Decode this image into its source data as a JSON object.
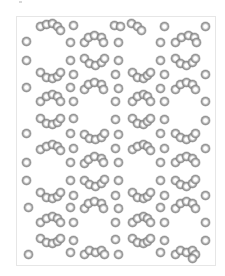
{
  "figure": {
    "sphere_color": "#7a7a7a",
    "highlight_color": "#ffffff",
    "frame_border_color": "#e6e6e6",
    "background_color": "#ffffff"
  },
  "spheres": [
    [
      40,
      26
    ],
    [
      46,
      24
    ],
    [
      52,
      23
    ],
    [
      57,
      26
    ],
    [
      60,
      30
    ],
    [
      73,
      25
    ],
    [
      114,
      25
    ],
    [
      120,
      26
    ],
    [
      131,
      23
    ],
    [
      137,
      26
    ],
    [
      141,
      30
    ],
    [
      164,
      26
    ],
    [
      205,
      26
    ],
    [
      26,
      41
    ],
    [
      70,
      42
    ],
    [
      84,
      42
    ],
    [
      88,
      37
    ],
    [
      94,
      35
    ],
    [
      101,
      37
    ],
    [
      103,
      42
    ],
    [
      118,
      42
    ],
    [
      160,
      42
    ],
    [
      175,
      42
    ],
    [
      181,
      37
    ],
    [
      188,
      35
    ],
    [
      194,
      37
    ],
    [
      196,
      42
    ],
    [
      26,
      60
    ],
    [
      70,
      60
    ],
    [
      84,
      58
    ],
    [
      89,
      63
    ],
    [
      95,
      65
    ],
    [
      101,
      62
    ],
    [
      104,
      58
    ],
    [
      118,
      60
    ],
    [
      160,
      60
    ],
    [
      175,
      58
    ],
    [
      180,
      63
    ],
    [
      186,
      65
    ],
    [
      192,
      62
    ],
    [
      195,
      58
    ],
    [
      40,
      72
    ],
    [
      46,
      77
    ],
    [
      52,
      78
    ],
    [
      57,
      76
    ],
    [
      60,
      72
    ],
    [
      73,
      74
    ],
    [
      115,
      74
    ],
    [
      132,
      72
    ],
    [
      137,
      77
    ],
    [
      143,
      78
    ],
    [
      147,
      75
    ],
    [
      150,
      72
    ],
    [
      164,
      74
    ],
    [
      205,
      74
    ],
    [
      26,
      87
    ],
    [
      70,
      87
    ],
    [
      84,
      89
    ],
    [
      88,
      84
    ],
    [
      94,
      82
    ],
    [
      101,
      84
    ],
    [
      103,
      89
    ],
    [
      118,
      88
    ],
    [
      160,
      88
    ],
    [
      175,
      89
    ],
    [
      180,
      84
    ],
    [
      186,
      82
    ],
    [
      192,
      84
    ],
    [
      195,
      89
    ],
    [
      40,
      101
    ],
    [
      46,
      96
    ],
    [
      52,
      94
    ],
    [
      57,
      96
    ],
    [
      60,
      101
    ],
    [
      73,
      101
    ],
    [
      115,
      101
    ],
    [
      132,
      101
    ],
    [
      137,
      96
    ],
    [
      143,
      94
    ],
    [
      147,
      96
    ],
    [
      150,
      101
    ],
    [
      164,
      101
    ],
    [
      205,
      101
    ],
    [
      40,
      118
    ],
    [
      46,
      123
    ],
    [
      52,
      124
    ],
    [
      57,
      122
    ],
    [
      60,
      118
    ],
    [
      73,
      118
    ],
    [
      115,
      119
    ],
    [
      132,
      118
    ],
    [
      137,
      123
    ],
    [
      143,
      124
    ],
    [
      147,
      121
    ],
    [
      150,
      118
    ],
    [
      164,
      119
    ],
    [
      205,
      120
    ],
    [
      26,
      133
    ],
    [
      70,
      133
    ],
    [
      84,
      134
    ],
    [
      89,
      138
    ],
    [
      95,
      139
    ],
    [
      101,
      137
    ],
    [
      104,
      133
    ],
    [
      118,
      134
    ],
    [
      160,
      133
    ],
    [
      175,
      133
    ],
    [
      180,
      137
    ],
    [
      186,
      139
    ],
    [
      192,
      137
    ],
    [
      195,
      133
    ],
    [
      40,
      149
    ],
    [
      46,
      146
    ],
    [
      52,
      144
    ],
    [
      57,
      146
    ],
    [
      60,
      150
    ],
    [
      73,
      148
    ],
    [
      115,
      148
    ],
    [
      132,
      149
    ],
    [
      137,
      146
    ],
    [
      143,
      144
    ],
    [
      147,
      146
    ],
    [
      150,
      150
    ],
    [
      164,
      148
    ],
    [
      205,
      148
    ],
    [
      26,
      162
    ],
    [
      70,
      162
    ],
    [
      84,
      163
    ],
    [
      88,
      159
    ],
    [
      94,
      156
    ],
    [
      101,
      158
    ],
    [
      103,
      162
    ],
    [
      118,
      162
    ],
    [
      160,
      162
    ],
    [
      175,
      162
    ],
    [
      180,
      158
    ],
    [
      186,
      156
    ],
    [
      192,
      158
    ],
    [
      195,
      162
    ],
    [
      26,
      180
    ],
    [
      70,
      180
    ],
    [
      84,
      180
    ],
    [
      89,
      184
    ],
    [
      95,
      186
    ],
    [
      101,
      183
    ],
    [
      104,
      179
    ],
    [
      118,
      180
    ],
    [
      160,
      180
    ],
    [
      175,
      180
    ],
    [
      180,
      184
    ],
    [
      186,
      186
    ],
    [
      192,
      183
    ],
    [
      195,
      179
    ],
    [
      40,
      192
    ],
    [
      46,
      197
    ],
    [
      52,
      198
    ],
    [
      57,
      196
    ],
    [
      60,
      192
    ],
    [
      73,
      195
    ],
    [
      115,
      195
    ],
    [
      132,
      192
    ],
    [
      137,
      197
    ],
    [
      143,
      198
    ],
    [
      147,
      196
    ],
    [
      150,
      192
    ],
    [
      164,
      195
    ],
    [
      205,
      195
    ],
    [
      28,
      207
    ],
    [
      70,
      207
    ],
    [
      84,
      208
    ],
    [
      88,
      203
    ],
    [
      94,
      201
    ],
    [
      101,
      203
    ],
    [
      103,
      208
    ],
    [
      118,
      208
    ],
    [
      160,
      207
    ],
    [
      175,
      208
    ],
    [
      180,
      203
    ],
    [
      186,
      201
    ],
    [
      192,
      203
    ],
    [
      195,
      208
    ],
    [
      40,
      222
    ],
    [
      46,
      218
    ],
    [
      52,
      216
    ],
    [
      57,
      218
    ],
    [
      60,
      222
    ],
    [
      73,
      222
    ],
    [
      115,
      222
    ],
    [
      132,
      222
    ],
    [
      137,
      218
    ],
    [
      143,
      216
    ],
    [
      147,
      218
    ],
    [
      150,
      222
    ],
    [
      164,
      222
    ],
    [
      205,
      222
    ],
    [
      40,
      238
    ],
    [
      46,
      242
    ],
    [
      52,
      243
    ],
    [
      57,
      241
    ],
    [
      60,
      238
    ],
    [
      73,
      240
    ],
    [
      115,
      239
    ],
    [
      132,
      238
    ],
    [
      137,
      242
    ],
    [
      143,
      243
    ],
    [
      147,
      241
    ],
    [
      150,
      238
    ],
    [
      164,
      240
    ],
    [
      205,
      240
    ],
    [
      28,
      254
    ],
    [
      70,
      252
    ],
    [
      84,
      254
    ],
    [
      89,
      250
    ],
    [
      95,
      252
    ],
    [
      101,
      250
    ],
    [
      104,
      254
    ],
    [
      118,
      254
    ],
    [
      160,
      252
    ],
    [
      175,
      254
    ],
    [
      180,
      250
    ],
    [
      186,
      252
    ],
    [
      192,
      250
    ],
    [
      195,
      254
    ],
    [
      192,
      258
    ]
  ]
}
